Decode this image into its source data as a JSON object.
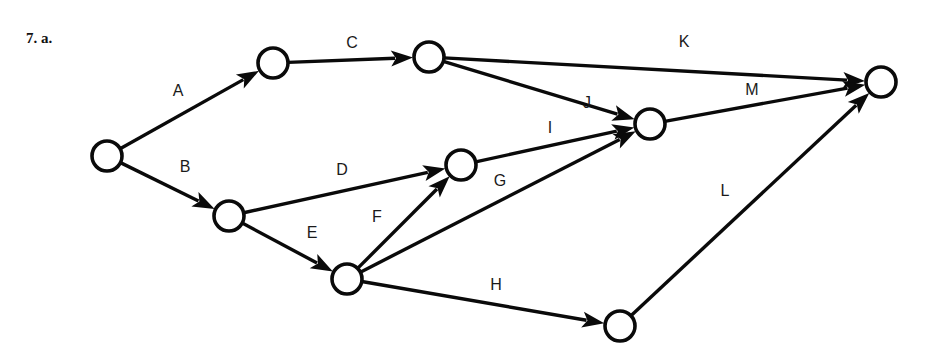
{
  "problem": {
    "label": "7.  a."
  },
  "diagram": {
    "type": "activity-on-arrow network",
    "node_radius": 15,
    "nodes": [
      {
        "id": "n1",
        "x": 107,
        "y": 156
      },
      {
        "id": "n2",
        "x": 273,
        "y": 63
      },
      {
        "id": "n3",
        "x": 429,
        "y": 57
      },
      {
        "id": "n4",
        "x": 229,
        "y": 216
      },
      {
        "id": "n5",
        "x": 461,
        "y": 165
      },
      {
        "id": "n6",
        "x": 347,
        "y": 279
      },
      {
        "id": "n7",
        "x": 650,
        "y": 124
      },
      {
        "id": "n8",
        "x": 620,
        "y": 326
      },
      {
        "id": "n9",
        "x": 881,
        "y": 82
      }
    ],
    "edges": [
      {
        "label": "A",
        "from": "n1",
        "to": "n2",
        "lx": 178,
        "ly": 96
      },
      {
        "label": "B",
        "from": "n1",
        "to": "n4",
        "lx": 185,
        "ly": 172
      },
      {
        "label": "C",
        "from": "n2",
        "to": "n3",
        "lx": 352,
        "ly": 48
      },
      {
        "label": "D",
        "from": "n4",
        "to": "n5",
        "lx": 342,
        "ly": 175
      },
      {
        "label": "E",
        "from": "n4",
        "to": "n6",
        "lx": 312,
        "ly": 238
      },
      {
        "label": "F",
        "from": "n6",
        "to": "n5",
        "lx": 377,
        "ly": 222
      },
      {
        "label": "G",
        "from": "n6",
        "to": "n7",
        "lx": 500,
        "ly": 186
      },
      {
        "label": "H",
        "from": "n6",
        "to": "n8",
        "lx": 496,
        "ly": 290
      },
      {
        "label": "I",
        "from": "n5",
        "to": "n7",
        "lx": 550,
        "ly": 133
      },
      {
        "label": "J",
        "from": "n3",
        "to": "n7",
        "lx": 587,
        "ly": 108
      },
      {
        "label": "K",
        "from": "n3",
        "to": "n9",
        "lx": 684,
        "ly": 47
      },
      {
        "label": "L",
        "from": "n8",
        "to": "n9",
        "lx": 725,
        "ly": 196
      },
      {
        "label": "M",
        "from": "n7",
        "to": "n9",
        "lx": 752,
        "ly": 95
      }
    ]
  }
}
